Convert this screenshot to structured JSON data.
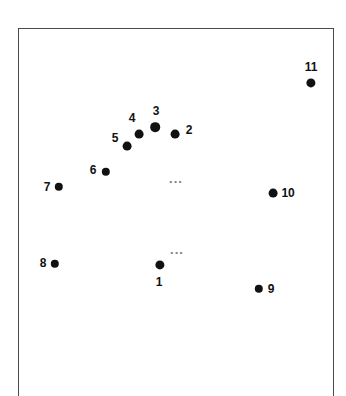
{
  "figure": {
    "type": "scatter-diagram",
    "background_color": "#ffffff",
    "frame": {
      "border_color": "#4a4a4a",
      "open_side": "bottom"
    },
    "point_color": "#111111",
    "label_color": "#111111",
    "ellipsis_color": "#7d7d7d"
  },
  "points": [
    {
      "label": "1",
      "x": 160,
      "y": 265,
      "r": 4.6,
      "label_x": 159,
      "label_y": 282
    },
    {
      "label": "2",
      "x": 175,
      "y": 134,
      "r": 4.4,
      "label_x": 189,
      "label_y": 130
    },
    {
      "label": "3",
      "x": 155,
      "y": 127,
      "r": 4.8,
      "label_x": 156,
      "label_y": 111
    },
    {
      "label": "4",
      "x": 139,
      "y": 134,
      "r": 4.4,
      "label_x": 132,
      "label_y": 118
    },
    {
      "label": "5",
      "x": 127,
      "y": 146,
      "r": 4.4,
      "label_x": 115,
      "label_y": 138
    },
    {
      "label": "6",
      "x": 106,
      "y": 172,
      "r": 4.2,
      "label_x": 93,
      "label_y": 170
    },
    {
      "label": "7",
      "x": 59,
      "y": 187,
      "r": 4.2,
      "label_x": 47,
      "label_y": 187
    },
    {
      "label": "8",
      "x": 55,
      "y": 264,
      "r": 4.2,
      "label_x": 43,
      "label_y": 263
    },
    {
      "label": "9",
      "x": 259,
      "y": 289,
      "r": 4.2,
      "label_x": 271,
      "label_y": 289
    },
    {
      "label": "10",
      "x": 273,
      "y": 193,
      "r": 4.4,
      "label_x": 288,
      "label_y": 193
    },
    {
      "label": "11",
      "x": 311,
      "y": 83,
      "r": 4.6,
      "label_x": 311,
      "label_y": 67
    }
  ],
  "ellipses": [
    {
      "text": "...",
      "x": 176,
      "y": 178
    },
    {
      "text": "...",
      "x": 177,
      "y": 249
    }
  ]
}
